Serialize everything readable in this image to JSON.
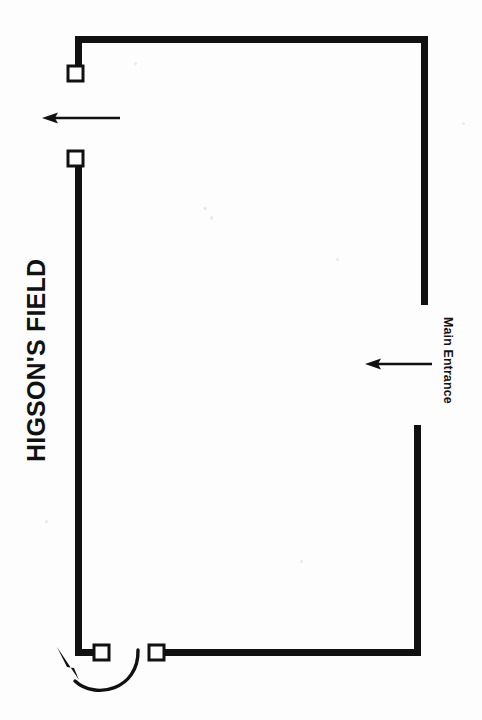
{
  "diagram": {
    "title_label": "HIGSON'S FIELD",
    "entrance_label": "Main Entrance",
    "type": "site-plan",
    "background_color": "#fdfdfd",
    "line_color": "#111111",
    "wall_thickness": 7,
    "canvas": {
      "width": 482,
      "height": 720
    },
    "walls": [
      {
        "name": "top-wall",
        "x1": 75,
        "y1": 36,
        "x2": 428,
        "y2": 36
      },
      {
        "name": "top-left-stub",
        "x1": 75,
        "y1": 36,
        "x2": 75,
        "y2": 67
      },
      {
        "name": "right-wall-upper",
        "x1": 428,
        "y1": 36,
        "x2": 428,
        "y2": 305
      },
      {
        "name": "right-wall-lower",
        "x1": 421,
        "y1": 425,
        "x2": 421,
        "y2": 656
      },
      {
        "name": "bottom-wall-right",
        "x1": 421,
        "y1": 656,
        "x2": 163,
        "y2": 656
      },
      {
        "name": "left-wall",
        "x1": 75,
        "y1": 164,
        "x2": 75,
        "y2": 656
      },
      {
        "name": "bottom-wall-left",
        "x1": 75,
        "y1": 656,
        "x2": 95,
        "y2": 656
      }
    ],
    "gate_markers": [
      {
        "name": "gate-marker-top-left",
        "x": 75,
        "y": 73
      },
      {
        "name": "gate-marker-upper-left",
        "x": 75,
        "y": 158
      },
      {
        "name": "gate-marker-bottom-inner",
        "x": 101,
        "y": 656
      },
      {
        "name": "gate-marker-bottom-outer",
        "x": 156,
        "y": 656
      }
    ],
    "arrows": [
      {
        "name": "exit-flow-arrow",
        "direction": "left",
        "x_start": 120,
        "x_end": 42,
        "y": 118
      },
      {
        "name": "main-entrance-arrow",
        "direction": "left",
        "x_start": 432,
        "x_end": 365,
        "y": 364
      }
    ],
    "curved_arrow": {
      "name": "turn-around-arrow",
      "description": "U-shaped curve sweeping below the bottom-left gate, head pointing up-left",
      "head_x": 57,
      "head_y": 647
    }
  }
}
